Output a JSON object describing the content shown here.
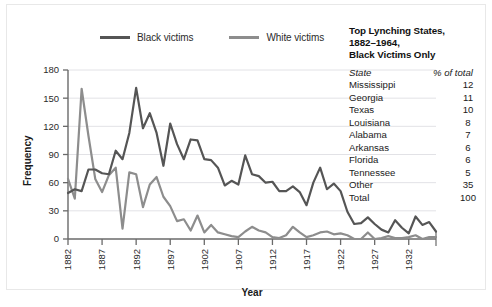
{
  "legend": {
    "items": [
      {
        "label": "Black victims",
        "color": "#555555",
        "name": "legend-black-victims"
      },
      {
        "label": "White victims",
        "color": "#8d8d8d",
        "name": "legend-white-victims"
      }
    ]
  },
  "side_table": {
    "title_line1": "Top Lynching States,",
    "title_line2": "1882–1964,",
    "title_line3": "Black Victims Only",
    "header": {
      "state": "State",
      "pct": "% of total"
    },
    "rows": [
      {
        "state": "Mississippi",
        "pct": "12"
      },
      {
        "state": "Georgia",
        "pct": "11"
      },
      {
        "state": "Texas",
        "pct": "10"
      },
      {
        "state": "Louisiana",
        "pct": "8"
      },
      {
        "state": "Alabama",
        "pct": "7"
      },
      {
        "state": "Arkansas",
        "pct": "6"
      },
      {
        "state": "Florida",
        "pct": "6"
      },
      {
        "state": "Tennessee",
        "pct": "5"
      },
      {
        "state": "Other",
        "pct": "35"
      },
      {
        "state": "Total",
        "pct": "100"
      }
    ]
  },
  "chart_data": {
    "type": "line",
    "title": "",
    "xlabel": "Year",
    "ylabel": "Frequency",
    "xlim": [
      1882,
      1936
    ],
    "ylim": [
      0,
      180
    ],
    "yticks": [
      0,
      30,
      60,
      90,
      120,
      150,
      180
    ],
    "xticks": [
      1882,
      1887,
      1892,
      1897,
      1902,
      1907,
      1912,
      1917,
      1922,
      1927,
      1932
    ],
    "grid": true,
    "legend_position": "top",
    "x": [
      1882,
      1883,
      1884,
      1885,
      1886,
      1887,
      1888,
      1889,
      1890,
      1891,
      1892,
      1893,
      1894,
      1895,
      1896,
      1897,
      1898,
      1899,
      1900,
      1901,
      1902,
      1903,
      1904,
      1905,
      1906,
      1907,
      1908,
      1909,
      1910,
      1911,
      1912,
      1913,
      1914,
      1915,
      1916,
      1917,
      1918,
      1919,
      1920,
      1921,
      1922,
      1923,
      1924,
      1925,
      1926,
      1927,
      1928,
      1929,
      1930,
      1931,
      1932,
      1933,
      1934,
      1935,
      1936
    ],
    "series": [
      {
        "name": "Black victims",
        "color": "#555555",
        "values": [
          49,
          53,
          51,
          74,
          74,
          70,
          69,
          94,
          85,
          113,
          161,
          118,
          134,
          113,
          78,
          123,
          101,
          85,
          106,
          105,
          85,
          84,
          76,
          57,
          62,
          58,
          89,
          69,
          67,
          60,
          61,
          51,
          51,
          56,
          50,
          36,
          60,
          76,
          53,
          59,
          51,
          29,
          16,
          17,
          23,
          16,
          10,
          7,
          20,
          12,
          6,
          24,
          15,
          18,
          8
        ]
      },
      {
        "name": "White victims",
        "color": "#8d8d8d",
        "values": [
          64,
          43,
          160,
          110,
          64,
          50,
          68,
          76,
          11,
          71,
          69,
          34,
          58,
          66,
          45,
          35,
          19,
          21,
          9,
          25,
          7,
          15,
          7,
          5,
          3,
          2,
          8,
          13,
          9,
          7,
          2,
          1,
          4,
          13,
          7,
          2,
          4,
          7,
          8,
          5,
          6,
          4,
          0,
          0,
          7,
          0,
          1,
          3,
          1,
          1,
          2,
          4,
          0,
          2,
          2
        ]
      }
    ]
  }
}
